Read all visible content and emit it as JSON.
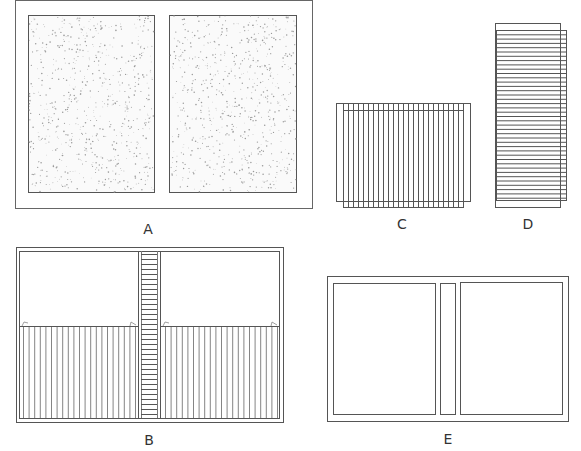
{
  "figures": {
    "A": {
      "label": "A",
      "description": "Open book cover with two stippled panels"
    },
    "B": {
      "label": "B",
      "description": "Open book showing pages with center ladder spine and ruled lower halves"
    },
    "C": {
      "label": "C",
      "description": "Stack of pages with vertical ruling, offset"
    },
    "D": {
      "label": "D",
      "description": "Stack of pages with horizontal ruling, offset"
    },
    "E": {
      "label": "E",
      "description": "Open case with two boards and a spine panel"
    }
  },
  "colors": {
    "line": "#555555",
    "stipple": "#9a9a9a",
    "label": "#333333"
  }
}
